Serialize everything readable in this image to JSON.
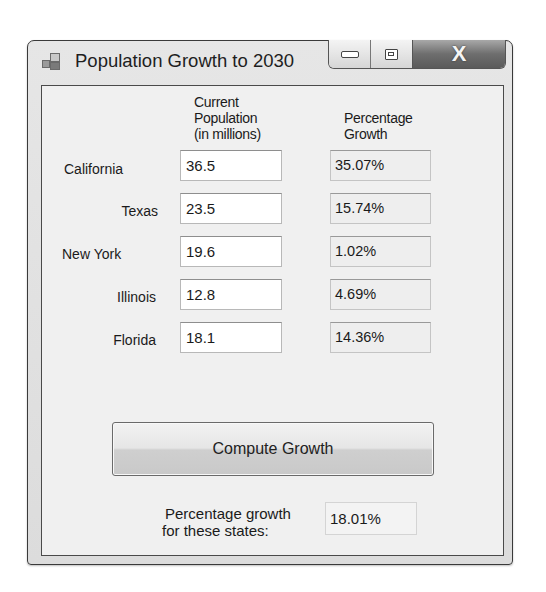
{
  "window": {
    "title": "Population Growth to 2030",
    "icon": "application-icon",
    "caption_buttons": {
      "minimize": "minimize-icon",
      "maximize": "maximize-icon",
      "close": "close-icon",
      "close_glyph": "X"
    }
  },
  "headers": {
    "population": [
      "Current",
      "Population",
      "(in millions)"
    ],
    "growth": [
      "Percentage",
      "Growth"
    ]
  },
  "rows": [
    {
      "state": "California",
      "population": "36.5",
      "growth": "35.07%"
    },
    {
      "state": "Texas",
      "population": "23.5",
      "growth": "15.74%"
    },
    {
      "state": "New York",
      "population": "19.6",
      "growth": "1.02%"
    },
    {
      "state": "Illinois",
      "population": "12.8",
      "growth": "4.69%"
    },
    {
      "state": "Florida",
      "population": "18.1",
      "growth": "14.36%"
    }
  ],
  "compute_button": {
    "label": "Compute Growth"
  },
  "total": {
    "label_line1": "Percentage growth",
    "label_line2": "for these states:",
    "value": "18.01%"
  }
}
